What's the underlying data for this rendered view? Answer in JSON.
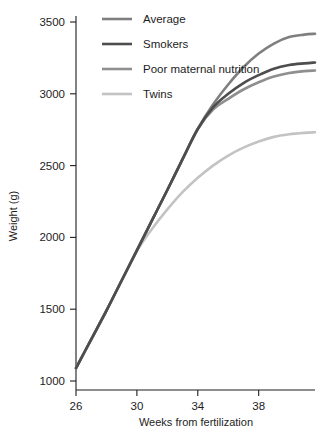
{
  "chart_data": {
    "type": "line",
    "title": "",
    "xlabel": "Weeks from fertilization",
    "ylabel": "Weight (g)",
    "xlim": [
      26,
      41.7
    ],
    "ylim": [
      960,
      3560
    ],
    "xticks": [
      26,
      30,
      34,
      38
    ],
    "yticks": [
      1000,
      1500,
      2000,
      2500,
      3000,
      3500
    ],
    "xtick_labels": [
      "26",
      "30",
      "34",
      "38"
    ],
    "ytick_labels": [
      "1000",
      "1500",
      "2000",
      "2500",
      "3000",
      "3500"
    ],
    "grid": false,
    "legend_position": "top-left",
    "x": [
      26,
      27,
      28,
      29,
      30,
      31,
      32,
      33,
      34,
      35,
      36,
      37,
      38,
      39,
      40,
      41,
      41.7
    ],
    "series": [
      {
        "name": "Average",
        "color": "#7f7f7f",
        "width": 2.6,
        "values": [
          1090,
          1290,
          1490,
          1700,
          1910,
          2120,
          2330,
          2545,
          2755,
          2925,
          3065,
          3185,
          3280,
          3350,
          3395,
          3412,
          3418
        ]
      },
      {
        "name": "Smokers",
        "color": "#4d4d4d",
        "width": 2.6,
        "values": [
          1090,
          1290,
          1490,
          1700,
          1910,
          2120,
          2330,
          2545,
          2755,
          2905,
          3000,
          3075,
          3130,
          3175,
          3200,
          3212,
          3218
        ]
      },
      {
        "name": "Poor maternal nutrition",
        "color": "#8f8f8f",
        "width": 2.6,
        "values": [
          1090,
          1290,
          1490,
          1700,
          1910,
          2120,
          2330,
          2545,
          2755,
          2890,
          2965,
          3030,
          3080,
          3120,
          3145,
          3158,
          3162
        ]
      },
      {
        "name": "Twins",
        "color": "#c3c3c3",
        "width": 2.6,
        "values": [
          1090,
          1290,
          1490,
          1700,
          1905,
          2060,
          2195,
          2315,
          2415,
          2500,
          2570,
          2625,
          2668,
          2700,
          2718,
          2728,
          2732
        ]
      }
    ]
  },
  "legend": {
    "entries": [
      {
        "label": "Average"
      },
      {
        "label": "Smokers"
      },
      {
        "label": "Poor maternal nutrition"
      },
      {
        "label": "Twins"
      }
    ]
  },
  "axes": {
    "y_title": "Weight (g)",
    "x_title": "Weeks from fertilization"
  },
  "colors": {
    "axis": "#1d1d1d",
    "text": "#1d1d1d",
    "background": "#ffffff"
  }
}
